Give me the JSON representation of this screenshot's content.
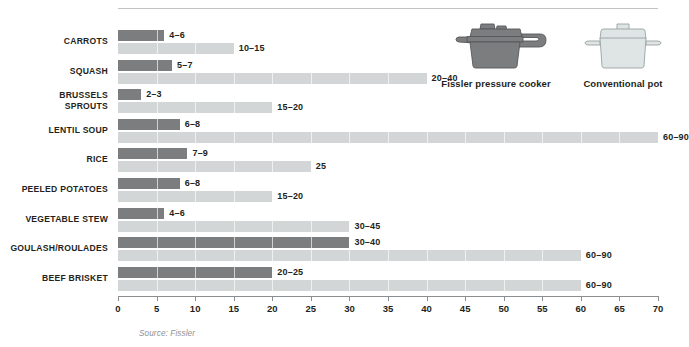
{
  "chart_data": {
    "type": "bar",
    "title": "",
    "subtitle": "",
    "xlabel": "",
    "ylabel": "",
    "xlim": [
      0,
      70
    ],
    "xticks": [
      0,
      5,
      10,
      15,
      20,
      25,
      30,
      35,
      40,
      45,
      50,
      55,
      60,
      65,
      70
    ],
    "grid": false,
    "orientation": "horizontal",
    "legend_position": "top-right",
    "categories": [
      "CARROTS",
      "SQUASH",
      "BRUSSELS\nSPROUTS",
      "LENTIL SOUP",
      "RICE",
      "PEELED POTATOES",
      "VEGETABLE STEW",
      "GOULASH/ROULADES",
      "BEEF BRISKET"
    ],
    "series": [
      {
        "name": "Fissler pressure cooker",
        "color": "#7b7d7f",
        "labels": [
          "4–6",
          "5–7",
          "2–3",
          "6–8",
          "7–9",
          "6–8",
          "4–6",
          "30–40",
          "20–25"
        ],
        "low": [
          4,
          5,
          2,
          6,
          7,
          6,
          4,
          30,
          20
        ],
        "high": [
          6,
          7,
          3,
          8,
          9,
          8,
          6,
          40,
          25
        ],
        "values": [
          6,
          7,
          3,
          8,
          9,
          8,
          6,
          30,
          20
        ]
      },
      {
        "name": "Conventional pot",
        "color": "#d2d6d7",
        "labels": [
          "10–15",
          "20–40",
          "15–20",
          "60–90",
          "25",
          "15–20",
          "30–45",
          "60–90",
          "60–90"
        ],
        "low": [
          10,
          20,
          15,
          60,
          25,
          15,
          30,
          60,
          60
        ],
        "high": [
          15,
          40,
          20,
          90,
          25,
          20,
          45,
          90,
          90
        ],
        "values": [
          15,
          40,
          20,
          70,
          25,
          20,
          30,
          60,
          60
        ]
      }
    ],
    "source": "Source: Fissler",
    "units": "minutes"
  },
  "legend": {
    "cooker": {
      "label": "Fissler pressure cooker",
      "icon": "pressure-cooker-icon",
      "color": "#7b7d7f"
    },
    "pot": {
      "label": "Conventional pot",
      "icon": "cooking-pot-icon",
      "color": "#dfe4e4"
    }
  },
  "footer": {
    "source": "Source: Fissler"
  }
}
